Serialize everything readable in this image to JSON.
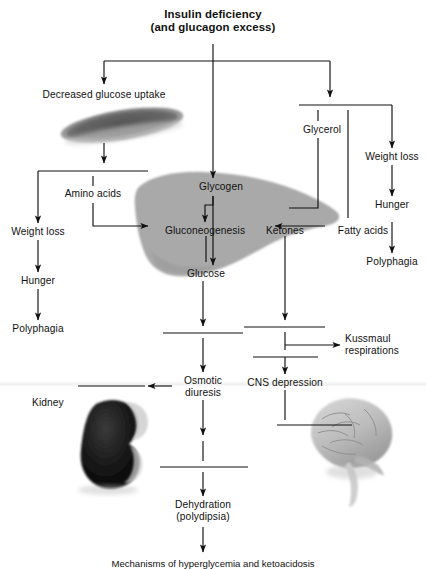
{
  "diagram": {
    "title_line1": "Insulin deficiency",
    "title_line2": "(and glucagon excess)",
    "caption": "Mechanisms of hyperglycemia and ketoacidosis",
    "ink": "#111111",
    "organ_fill": "#a9a9a9",
    "background": "#ffffff"
  },
  "nodes": {
    "decreased_glucose_uptake": "Decreased glucose uptake",
    "amino_acids": "Amino acids",
    "weight_loss_left": "Weight loss",
    "hunger_left": "Hunger",
    "polyphagia_left": "Polyphagia",
    "glycogen": "Glycogen",
    "gluconeogenesis": "Gluconeogenesis",
    "glucose": "Glucose",
    "ketones": "Ketones",
    "fatty_acids": "Fatty acids",
    "glycerol": "Glycerol",
    "weight_loss_right": "Weight loss",
    "hunger_right": "Hunger",
    "polyphagia_right": "Polyphagia",
    "osmotic_diuresis_line1": "Osmotic",
    "osmotic_diuresis_line2": "diuresis",
    "cns_depression": "CNS depression",
    "kussmaul_line1": "Kussmaul",
    "kussmaul_line2": "respirations",
    "dehydration_line1": "Dehydration",
    "dehydration_line2": "(polydipsia)"
  },
  "organ_labels": {
    "kidney": "Kidney",
    "muscle": "",
    "liver": "",
    "brain": ""
  },
  "blank_rules": [
    {
      "name": "blank-below-muscle-arrow",
      "x1": 38,
      "y1": 171,
      "x2": 148,
      "y2": 171
    },
    {
      "name": "blank-glycerol-top",
      "x1": 299,
      "y1": 105,
      "x2": 392,
      "y2": 105
    },
    {
      "name": "blank-below-glucose",
      "x1": 163,
      "y1": 333,
      "x2": 243,
      "y2": 333
    },
    {
      "name": "blank-below-ketones",
      "x1": 244,
      "y1": 327,
      "x2": 325,
      "y2": 327
    },
    {
      "name": "blank-cns-rule",
      "x1": 253,
      "y1": 357,
      "x2": 318,
      "y2": 357
    },
    {
      "name": "blank-kidney-rule",
      "x1": 78,
      "y1": 386,
      "x2": 145,
      "y2": 386
    },
    {
      "name": "blank-brain-rule",
      "x1": 277,
      "y1": 425,
      "x2": 352,
      "y2": 425
    },
    {
      "name": "blank-above-dehydration",
      "x1": 160,
      "y1": 467,
      "x2": 248,
      "y2": 467
    }
  ]
}
